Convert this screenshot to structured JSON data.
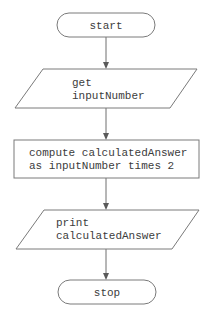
{
  "diagram": {
    "type": "flowchart",
    "colors": {
      "stroke": "#7a7a7a",
      "text": "#3c3c3c",
      "background": "#ffffff"
    },
    "nodes": [
      {
        "id": "start",
        "shape": "terminator",
        "lines": [
          "start"
        ]
      },
      {
        "id": "input",
        "shape": "parallelogram",
        "lines": [
          "get",
          "inputNumber"
        ]
      },
      {
        "id": "process",
        "shape": "rectangle",
        "lines": [
          "compute calculatedAnswer",
          "as inputNumber times 2"
        ]
      },
      {
        "id": "output",
        "shape": "parallelogram",
        "lines": [
          "print",
          "calculatedAnswer"
        ]
      },
      {
        "id": "stop",
        "shape": "terminator",
        "lines": [
          "stop"
        ]
      }
    ],
    "edges": [
      {
        "from": "start",
        "to": "input"
      },
      {
        "from": "input",
        "to": "process"
      },
      {
        "from": "process",
        "to": "output"
      },
      {
        "from": "output",
        "to": "stop"
      }
    ]
  }
}
